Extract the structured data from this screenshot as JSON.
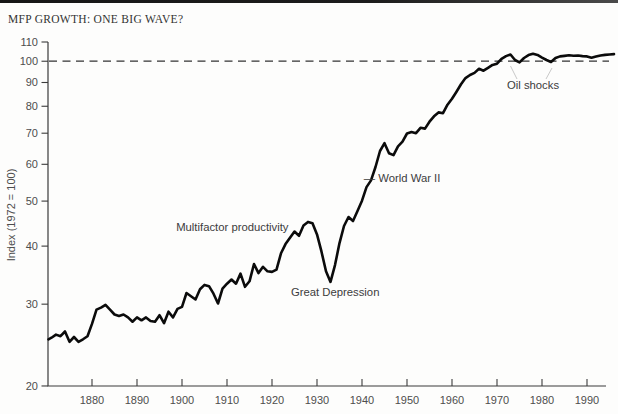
{
  "header": {
    "title": "MFP GROWTH: ONE BIG WAVE?"
  },
  "chart_data": {
    "type": "line",
    "title": "MFP GROWTH: ONE BIG WAVE?",
    "xlabel": "",
    "ylabel": "Index (1972 = 100)",
    "y_scale": "log",
    "xlim": [
      1870,
      1996
    ],
    "ylim": [
      20,
      110
    ],
    "x_ticks": [
      1880,
      1890,
      1900,
      1910,
      1920,
      1930,
      1940,
      1950,
      1960,
      1970,
      1980,
      1990
    ],
    "y_ticks": [
      20,
      30,
      40,
      50,
      60,
      70,
      80,
      90,
      100,
      110
    ],
    "grid": "off",
    "legend": "none",
    "line_color": "#0b0b0b",
    "reference_line": {
      "value": 100,
      "style": "dashed",
      "color": "#333333"
    },
    "series": [
      {
        "name": "Multifactor productivity",
        "x": [
          1870,
          1871,
          1872,
          1873,
          1874,
          1875,
          1876,
          1877,
          1878,
          1879,
          1880,
          1881,
          1882,
          1883,
          1884,
          1885,
          1886,
          1887,
          1888,
          1889,
          1890,
          1891,
          1892,
          1893,
          1894,
          1895,
          1896,
          1897,
          1898,
          1899,
          1900,
          1901,
          1902,
          1903,
          1904,
          1905,
          1906,
          1907,
          1908,
          1909,
          1910,
          1911,
          1912,
          1913,
          1914,
          1915,
          1916,
          1917,
          1918,
          1919,
          1920,
          1921,
          1922,
          1923,
          1924,
          1925,
          1926,
          1927,
          1928,
          1929,
          1930,
          1931,
          1932,
          1933,
          1934,
          1935,
          1936,
          1937,
          1938,
          1939,
          1940,
          1941,
          1942,
          1943,
          1944,
          1945,
          1946,
          1947,
          1948,
          1949,
          1950,
          1951,
          1952,
          1953,
          1954,
          1955,
          1956,
          1957,
          1958,
          1959,
          1960,
          1961,
          1962,
          1963,
          1964,
          1965,
          1966,
          1967,
          1968,
          1969,
          1970,
          1971,
          1972,
          1973,
          1974,
          1975,
          1976,
          1977,
          1978,
          1979,
          1980,
          1981,
          1982,
          1983,
          1984,
          1985,
          1986,
          1987,
          1988,
          1989,
          1990,
          1991,
          1992,
          1993,
          1994,
          1995,
          1996
        ],
        "values": [
          25.2,
          25.4,
          25.8,
          25.6,
          26.2,
          24.9,
          25.5,
          24.9,
          25.2,
          25.6,
          27.2,
          29.2,
          29.5,
          29.9,
          29.2,
          28.5,
          28.3,
          28.5,
          28.1,
          27.5,
          28.1,
          27.7,
          28.1,
          27.6,
          27.5,
          28.4,
          27.3,
          28.9,
          28.1,
          29.3,
          29.6,
          31.7,
          31.2,
          30.7,
          32.3,
          33.0,
          32.8,
          31.6,
          30.1,
          32.4,
          33.2,
          33.9,
          33.2,
          34.9,
          32.7,
          33.6,
          36.6,
          35.0,
          36.1,
          35.3,
          35.2,
          35.6,
          38.6,
          40.4,
          41.7,
          43.0,
          42.1,
          44.3,
          45.1,
          44.8,
          42.4,
          38.9,
          35.3,
          33.5,
          36.4,
          40.6,
          44.2,
          46.2,
          45.3,
          47.6,
          50.1,
          53.6,
          55.4,
          59.2,
          64.1,
          66.6,
          63.4,
          62.8,
          65.6,
          67.1,
          69.9,
          70.4,
          70.0,
          71.9,
          71.6,
          74.1,
          76.1,
          77.6,
          77.3,
          80.6,
          83.0,
          86.0,
          89.2,
          92.0,
          93.4,
          94.4,
          96.3,
          95.4,
          96.8,
          98.2,
          98.8,
          101.2,
          102.6,
          103.4,
          100.6,
          99.4,
          101.6,
          103.1,
          103.8,
          103.2,
          101.8,
          100.6,
          99.6,
          101.6,
          102.4,
          102.7,
          103.0,
          102.8,
          102.9,
          102.6,
          102.4,
          101.7,
          102.3,
          102.9,
          103.2,
          103.4,
          103.6
        ]
      }
    ],
    "annotations": [
      {
        "text": "Multifactor productivity",
        "year": 1898.7,
        "value": 44.0,
        "align": "left"
      },
      {
        "text": "Great Depression",
        "year": 1924.2,
        "value": 31.9,
        "align": "left"
      },
      {
        "text": "— World War II",
        "year": 1940.4,
        "value": 56.0,
        "align": "left"
      },
      {
        "text": "Oil shocks",
        "year": 1978.0,
        "value": 88.7,
        "align": "middle"
      }
    ]
  }
}
